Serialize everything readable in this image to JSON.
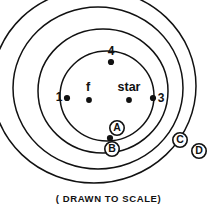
{
  "figure": {
    "caption": "( DRAWN TO SCALE)",
    "stroke_color": "#111111",
    "background_color": "#ffffff"
  },
  "orbits": [
    {
      "tag": "A",
      "tag_x": 117,
      "tag_y": 128,
      "cx": 107,
      "cy": 96,
      "rx": 47,
      "ry": 45
    },
    {
      "tag": "B",
      "tag_x": 112,
      "tag_y": 149,
      "cx": 103,
      "cy": 91,
      "rx": 65,
      "ry": 62
    },
    {
      "tag": "C",
      "tag_x": 180,
      "tag_y": 140,
      "cx": 98,
      "cy": 88,
      "rx": 85,
      "ry": 81
    },
    {
      "tag": "D",
      "tag_x": 199,
      "tag_y": 151,
      "cx": 94,
      "cy": 86,
      "rx": 102,
      "ry": 97
    }
  ],
  "nodes": [
    {
      "label": "1",
      "dot_x": 67,
      "dot_y": 98,
      "label_x": 59,
      "label_y": 98
    },
    {
      "label": "2",
      "dot_x": 110,
      "dot_y": 138,
      "label_x": 110,
      "label_y": 151
    },
    {
      "label": "3",
      "dot_x": 153,
      "dot_y": 98,
      "label_x": 161,
      "label_y": 99
    },
    {
      "label": "4",
      "dot_x": 111,
      "dot_y": 62,
      "label_x": 111,
      "label_y": 52
    }
  ],
  "bodies": [
    {
      "label": "f",
      "dot_x": 89,
      "dot_y": 100,
      "label_x": 88,
      "label_y": 88
    },
    {
      "label": "star",
      "dot_x": 129,
      "dot_y": 100,
      "label_x": 129,
      "label_y": 88
    }
  ]
}
